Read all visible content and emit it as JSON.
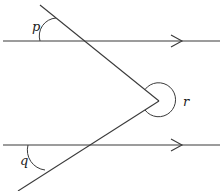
{
  "diagram": {
    "type": "parallel lines with transversals",
    "parallel_lines": [
      {
        "id": "top",
        "y": 41,
        "x_start": 3,
        "x_end": 220,
        "arrow_x": 182
      },
      {
        "id": "bottom",
        "y": 145,
        "x_start": 3,
        "x_end": 220,
        "arrow_x": 182
      }
    ],
    "vertex": {
      "x": 159,
      "y": 101
    },
    "transversals": [
      {
        "id": "upper",
        "from": [
          40,
          5
        ],
        "to": [
          159,
          101
        ]
      },
      {
        "id": "lower",
        "from": [
          159,
          101
        ],
        "to": [
          18,
          191
        ]
      }
    ],
    "angles": [
      {
        "name": "p",
        "label": "p",
        "label_pos": [
          32,
          31
        ]
      },
      {
        "name": "q",
        "label": "q",
        "label_pos": [
          20,
          165
        ]
      },
      {
        "name": "r",
        "label": "r",
        "label_pos": [
          183,
          106
        ]
      }
    ],
    "colors": {
      "stroke": "#3a3a3a",
      "text": "#222222",
      "background": "#ffffff"
    }
  }
}
